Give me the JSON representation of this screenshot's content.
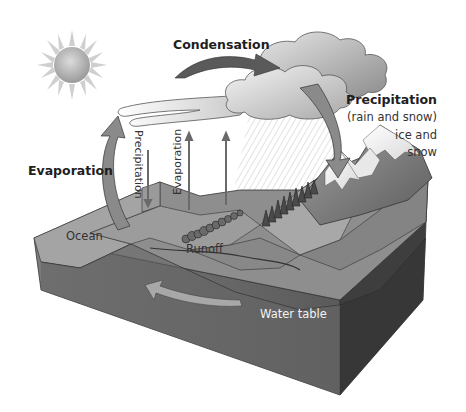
{
  "diagram": {
    "labels": {
      "condensation": "Condensation",
      "precipitation_title": "Precipitation",
      "precipitation_sub": "(rain and snow)",
      "ice_and": "ice and",
      "snow": "snow",
      "evaporation_main": "Evaporation",
      "precipitation_vertical": "Precipitation",
      "evaporation_vertical": "Evaporation",
      "ocean": "Ocean",
      "runoff": "Runoff",
      "water_table": "Water table"
    },
    "elements": [
      {
        "name": "sun-icon",
        "kind": "sun"
      },
      {
        "name": "cloud-bank",
        "kind": "clouds"
      },
      {
        "name": "condensation-arrow",
        "kind": "arrow"
      },
      {
        "name": "precipitation-arrow",
        "kind": "arrow"
      },
      {
        "name": "evaporation-arrow",
        "kind": "arrow"
      },
      {
        "name": "snow-capped-mountains",
        "kind": "terrain"
      },
      {
        "name": "trees",
        "kind": "vegetation"
      },
      {
        "name": "groundwater-flow-arrow",
        "kind": "arrow"
      },
      {
        "name": "terrain-block",
        "kind": "cross-section"
      }
    ],
    "colors": {
      "background": "#ffffff",
      "block_top": "#8e8e8e",
      "block_front": "#6a6a6a",
      "block_side": "#3e3e3e",
      "arrow": "#7a7a7a",
      "cloud": "#d0d0d0",
      "snow": "#f0f0f0",
      "text": "#222222"
    }
  }
}
